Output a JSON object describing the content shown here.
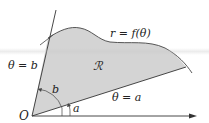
{
  "diagram": {
    "labels": {
      "curve": "r = f(θ)",
      "region": "ℛ",
      "ray_b": "θ = b",
      "ray_a": "θ = a",
      "angle_b": "b",
      "angle_a": "a",
      "origin": "O"
    },
    "colors": {
      "region_fill": "#d4d4d4",
      "stroke": "#333333",
      "background": "#ffffff"
    }
  }
}
